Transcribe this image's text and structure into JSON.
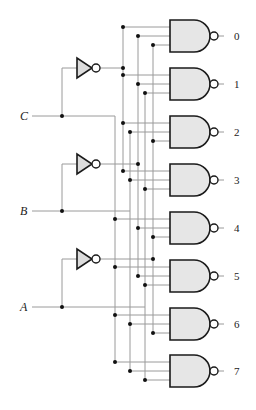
{
  "diagram": {
    "type": "3-to-8 decoder (NAND gates, active-low outputs)",
    "inputs": [
      {
        "name": "C",
        "y": 116,
        "bus_x": 115,
        "inv_bus_x": 123,
        "inv_y": 68
      },
      {
        "name": "B",
        "y": 211,
        "bus_x": 130,
        "inv_bus_x": 138,
        "inv_y": 164
      },
      {
        "name": "A",
        "y": 307,
        "bus_x": 145,
        "inv_bus_x": 153,
        "inv_y": 259
      }
    ],
    "outputs": [
      {
        "label": "0",
        "y": 36,
        "inputs": [
          "C'",
          "B'",
          "A'"
        ]
      },
      {
        "label": "1",
        "y": 84,
        "inputs": [
          "C'",
          "B'",
          "A"
        ]
      },
      {
        "label": "2",
        "y": 132,
        "inputs": [
          "C'",
          "B",
          "A'"
        ]
      },
      {
        "label": "3",
        "y": 180,
        "inputs": [
          "C'",
          "B",
          "A"
        ]
      },
      {
        "label": "4",
        "y": 228,
        "inputs": [
          "C",
          "B'",
          "A'"
        ]
      },
      {
        "label": "5",
        "y": 276,
        "inputs": [
          "C",
          "B'",
          "A"
        ]
      },
      {
        "label": "6",
        "y": 324,
        "inputs": [
          "C",
          "B",
          "A'"
        ]
      },
      {
        "label": "7",
        "y": 371,
        "inputs": [
          "C",
          "B",
          "A"
        ]
      }
    ],
    "colors": {
      "wire": "#9a9a9a",
      "gate_fill": "#e6e6e6",
      "gate_stroke": "#1a1a1a",
      "junction": "#111111"
    }
  }
}
